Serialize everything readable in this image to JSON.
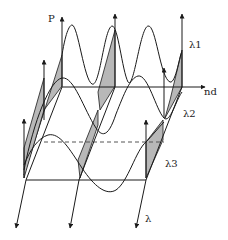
{
  "diagram": {
    "axis_labels": {
      "vertical": "P",
      "horizontal": "nd",
      "depth": "λ"
    },
    "wave_labels": [
      "λ1",
      "λ2",
      "λ3"
    ],
    "colors": {
      "line": "#1a1a1a",
      "shade": "#b8b8b8",
      "dashed": "#555555"
    }
  }
}
